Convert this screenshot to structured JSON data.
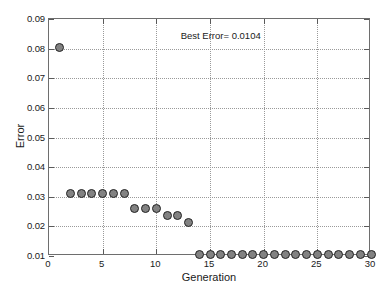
{
  "chart_data": {
    "type": "scatter",
    "title": "",
    "xlabel": "Generation",
    "ylabel": "Error",
    "xlim": [
      0,
      30
    ],
    "ylim": [
      0.01,
      0.09
    ],
    "xticks": [
      0,
      5,
      10,
      15,
      20,
      25,
      30
    ],
    "yticks": [
      0.01,
      0.02,
      0.03,
      0.04,
      0.05,
      0.06,
      0.07,
      0.08,
      0.09
    ],
    "ytick_labels": [
      "0.01",
      "0.02",
      "0.03",
      "0.04",
      "0.05",
      "0.06",
      "0.07",
      "0.08",
      "0.09"
    ],
    "xtick_labels": [
      "0",
      "5",
      "10",
      "15",
      "20",
      "25",
      "30"
    ],
    "grid": true,
    "legend": null,
    "annotations": [
      {
        "text": "Best Error= 0.0104",
        "x": 16.0,
        "y": 0.0845
      }
    ],
    "marker": {
      "shape": "circle",
      "fill_color": "#828282",
      "edge_color": "#232323",
      "size_px": 9
    },
    "series": [
      {
        "name": "Best Error per Generation",
        "x": [
          1,
          2,
          3,
          4,
          5,
          6,
          7,
          8,
          9,
          10,
          11,
          12,
          13,
          14,
          15,
          16,
          17,
          18,
          19,
          20,
          21,
          22,
          23,
          24,
          25,
          26,
          27,
          28,
          29,
          30
        ],
        "y": [
          0.0805,
          0.0312,
          0.0312,
          0.0312,
          0.0312,
          0.0312,
          0.0312,
          0.0262,
          0.0262,
          0.0262,
          0.0238,
          0.0238,
          0.0212,
          0.0104,
          0.0104,
          0.0104,
          0.0104,
          0.0104,
          0.0104,
          0.0104,
          0.0104,
          0.0104,
          0.0104,
          0.0104,
          0.0104,
          0.0104,
          0.0104,
          0.0104,
          0.0104,
          0.0104
        ]
      }
    ]
  },
  "colors": {
    "background": "#ffffff",
    "axis": "#6e6e6e",
    "grid": "#9a9a9a",
    "text": "#1a1a1a",
    "marker_fill": "#828282",
    "marker_edge": "#232323"
  }
}
